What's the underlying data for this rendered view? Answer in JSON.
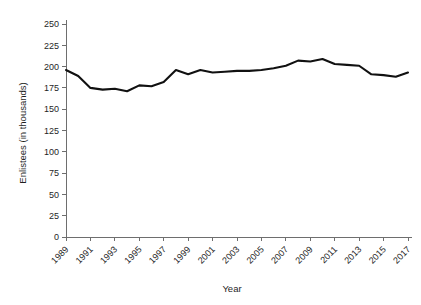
{
  "chart_data": {
    "type": "line",
    "title": "",
    "xlabel": "Year",
    "ylabel": "Enlistees (in thousands)",
    "xlim": [
      1989,
      2017
    ],
    "ylim": [
      0,
      250
    ],
    "grid": false,
    "legend": null,
    "y_ticks": [
      0,
      25,
      50,
      75,
      100,
      125,
      150,
      175,
      200,
      225,
      250
    ],
    "y_tick_labels": [
      "0",
      "25",
      "50",
      "75",
      "100",
      "125",
      "150",
      "175",
      "200",
      "225",
      "250"
    ],
    "x_ticks": [
      1989,
      1991,
      1993,
      1995,
      1997,
      1999,
      2001,
      2003,
      2005,
      2007,
      2009,
      2011,
      2013,
      2015,
      2017
    ],
    "x_tick_labels": [
      "1989",
      "1991",
      "1993",
      "1995",
      "1997",
      "1999",
      "2001",
      "2003",
      "2005",
      "2007",
      "2009",
      "2011",
      "2013",
      "2015",
      "2017"
    ],
    "series": [
      {
        "name": "Enlistees",
        "color": "#111111",
        "x": [
          1989,
          1990,
          1991,
          1992,
          1993,
          1994,
          1995,
          1996,
          1997,
          1998,
          1999,
          2000,
          2001,
          2002,
          2003,
          2004,
          2005,
          2006,
          2007,
          2008,
          2009,
          2010,
          2011,
          2012,
          2013,
          2014,
          2015,
          2016,
          2017
        ],
        "values": [
          196,
          189,
          175,
          173,
          174,
          171,
          178,
          177,
          182,
          196,
          191,
          196,
          193,
          194,
          195,
          195,
          196,
          198,
          201,
          207,
          206,
          209,
          203,
          202,
          201,
          191,
          190,
          188,
          193
        ]
      }
    ]
  }
}
